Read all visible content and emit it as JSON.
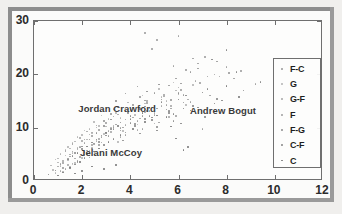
{
  "chart_data": {
    "type": "scatter",
    "title": "",
    "xlabel": "",
    "ylabel": "",
    "xlim": [
      0,
      12
    ],
    "ylim": [
      0,
      30
    ],
    "xticks": [
      0,
      2,
      4,
      6,
      8,
      10,
      12
    ],
    "yticks": [
      0,
      10,
      20,
      30
    ],
    "xtick_labels": [
      "0",
      "2",
      "4",
      "6",
      "8",
      "10",
      "12"
    ],
    "ytick_labels": [
      "0",
      "10",
      "20",
      "30"
    ],
    "grid": false,
    "legend_position": "right-inside",
    "legend": [
      {
        "label": "F-C",
        "color": "#9a9a9a"
      },
      {
        "label": "G",
        "color": "#b4b4b4"
      },
      {
        "label": "G-F",
        "color": "#a8a8a8"
      },
      {
        "label": "F",
        "color": "#a0a0a0"
      },
      {
        "label": "F-G",
        "color": "#909090"
      },
      {
        "label": "C-F",
        "color": "#888888"
      },
      {
        "label": "C",
        "color": "#7e7e7e"
      }
    ],
    "annotations": [
      {
        "text": "Jordan Crawford",
        "x": 3.45,
        "y": 13.6
      },
      {
        "text": "Andrew Bogut",
        "x": 7.85,
        "y": 13.3
      },
      {
        "text": "Jelani McCoy",
        "x": 3.2,
        "y": 5.4
      }
    ],
    "series": [
      {
        "name": "F-C",
        "color": "#9a9a9a",
        "points": [
          [
            1.1,
            3.2
          ],
          [
            1.4,
            4.1
          ],
          [
            1.6,
            5.5
          ],
          [
            1.9,
            6.3
          ],
          [
            2.1,
            7.8
          ],
          [
            2.4,
            9.1
          ],
          [
            2.6,
            10.4
          ],
          [
            2.9,
            11.2
          ],
          [
            3.2,
            12.6
          ],
          [
            3.5,
            13.9
          ],
          [
            3.8,
            11.5
          ],
          [
            4.1,
            14.2
          ],
          [
            4.4,
            15.8
          ],
          [
            4.7,
            13.1
          ],
          [
            5.0,
            16.5
          ],
          [
            5.3,
            14.8
          ],
          [
            5.6,
            17.9
          ],
          [
            5.9,
            19.2
          ],
          [
            6.2,
            16.1
          ],
          [
            6.5,
            20.4
          ],
          [
            1.2,
            2.4
          ],
          [
            1.8,
            3.6
          ],
          [
            2.2,
            5.1
          ],
          [
            2.7,
            6.8
          ],
          [
            3.1,
            8.4
          ],
          [
            3.6,
            9.9
          ],
          [
            4.0,
            10.8
          ],
          [
            4.5,
            12.2
          ],
          [
            5.1,
            13.6
          ],
          [
            5.7,
            15.2
          ],
          [
            6.1,
            18.3
          ],
          [
            6.8,
            21.1
          ],
          [
            7.2,
            19.6
          ],
          [
            7.6,
            22.4
          ],
          [
            8.1,
            20.2
          ],
          [
            2.3,
            4.4
          ],
          [
            2.8,
            7.2
          ],
          [
            3.3,
            10.1
          ],
          [
            3.9,
            12.9
          ],
          [
            4.6,
            15.1
          ]
        ]
      },
      {
        "name": "G",
        "color": "#b4b4b4",
        "points": [
          [
            0.8,
            2.1
          ],
          [
            1.0,
            3.5
          ],
          [
            1.3,
            4.8
          ],
          [
            1.5,
            6.1
          ],
          [
            1.7,
            7.4
          ],
          [
            2.0,
            8.6
          ],
          [
            2.3,
            9.8
          ],
          [
            2.5,
            11.1
          ],
          [
            2.8,
            12.3
          ],
          [
            3.0,
            10.2
          ],
          [
            3.3,
            13.5
          ],
          [
            3.6,
            11.8
          ],
          [
            3.9,
            14.7
          ],
          [
            4.2,
            12.4
          ],
          [
            4.5,
            16.0
          ],
          [
            4.8,
            13.7
          ],
          [
            5.2,
            17.2
          ],
          [
            5.5,
            15.0
          ],
          [
            5.8,
            18.5
          ],
          [
            6.0,
            16.3
          ],
          [
            0.9,
            1.5
          ],
          [
            1.1,
            2.8
          ],
          [
            1.4,
            3.9
          ],
          [
            1.6,
            5.2
          ],
          [
            1.9,
            6.5
          ],
          [
            2.2,
            7.8
          ],
          [
            2.4,
            9.0
          ],
          [
            2.7,
            10.3
          ],
          [
            3.1,
            11.6
          ],
          [
            3.4,
            12.8
          ],
          [
            3.7,
            9.4
          ],
          [
            4.0,
            13.2
          ],
          [
            4.3,
            10.6
          ],
          [
            4.6,
            14.5
          ],
          [
            4.9,
            11.9
          ],
          [
            5.3,
            15.7
          ],
          [
            5.6,
            13.0
          ],
          [
            5.9,
            17.0
          ],
          [
            6.3,
            14.2
          ],
          [
            6.6,
            18.0
          ],
          [
            1.0,
            4.2
          ],
          [
            1.3,
            5.8
          ],
          [
            1.6,
            7.1
          ],
          [
            1.8,
            8.3
          ],
          [
            2.1,
            9.5
          ],
          [
            2.4,
            6.2
          ],
          [
            2.6,
            7.5
          ],
          [
            2.9,
            8.8
          ],
          [
            3.2,
            10.0
          ],
          [
            3.5,
            7.3
          ],
          [
            1.2,
            1.8
          ],
          [
            1.5,
            2.6
          ],
          [
            1.7,
            3.4
          ],
          [
            2.0,
            4.3
          ],
          [
            2.3,
            5.6
          ],
          [
            0.7,
            2.9
          ],
          [
            0.9,
            4.0
          ],
          [
            1.1,
            5.1
          ],
          [
            1.4,
            6.4
          ],
          [
            1.6,
            3.1
          ]
        ]
      },
      {
        "name": "G-F",
        "color": "#a8a8a8",
        "points": [
          [
            1.0,
            2.7
          ],
          [
            1.2,
            3.8
          ],
          [
            1.5,
            5.0
          ],
          [
            1.8,
            6.2
          ],
          [
            2.0,
            7.5
          ],
          [
            2.3,
            8.7
          ],
          [
            2.6,
            10.0
          ],
          [
            2.9,
            11.3
          ],
          [
            3.2,
            9.2
          ],
          [
            3.5,
            12.5
          ],
          [
            3.8,
            10.5
          ],
          [
            4.1,
            13.8
          ],
          [
            4.4,
            11.7
          ],
          [
            4.7,
            15.0
          ],
          [
            5.0,
            12.8
          ],
          [
            5.4,
            16.2
          ],
          [
            5.7,
            14.1
          ],
          [
            6.0,
            17.5
          ],
          [
            6.4,
            15.3
          ],
          [
            6.7,
            18.8
          ],
          [
            1.1,
            1.9
          ],
          [
            1.4,
            3.0
          ],
          [
            1.7,
            4.2
          ],
          [
            2.1,
            5.4
          ],
          [
            2.4,
            6.7
          ],
          [
            2.7,
            7.9
          ],
          [
            3.0,
            9.1
          ],
          [
            3.3,
            10.4
          ],
          [
            3.6,
            8.2
          ],
          [
            4.0,
            11.6
          ],
          [
            4.3,
            9.6
          ],
          [
            4.6,
            12.9
          ],
          [
            5.0,
            10.8
          ],
          [
            5.3,
            14.1
          ],
          [
            5.6,
            12.0
          ],
          [
            1.3,
            5.6
          ],
          [
            1.6,
            6.9
          ],
          [
            1.9,
            8.1
          ],
          [
            2.2,
            9.3
          ],
          [
            2.5,
            7.0
          ]
        ]
      },
      {
        "name": "F",
        "color": "#a0a0a0",
        "points": [
          [
            1.2,
            3.4
          ],
          [
            1.5,
            4.6
          ],
          [
            1.8,
            5.9
          ],
          [
            2.1,
            7.1
          ],
          [
            2.4,
            8.4
          ],
          [
            2.7,
            9.6
          ],
          [
            3.0,
            10.9
          ],
          [
            3.3,
            12.1
          ],
          [
            3.7,
            10.0
          ],
          [
            4.0,
            13.4
          ],
          [
            4.3,
            11.2
          ],
          [
            4.7,
            14.6
          ],
          [
            5.0,
            12.4
          ],
          [
            5.4,
            15.9
          ],
          [
            5.7,
            13.6
          ],
          [
            6.1,
            17.1
          ],
          [
            6.5,
            14.8
          ],
          [
            6.9,
            18.4
          ],
          [
            7.3,
            16.0
          ],
          [
            7.7,
            19.6
          ],
          [
            1.3,
            2.2
          ],
          [
            1.6,
            3.3
          ],
          [
            1.9,
            4.5
          ],
          [
            2.2,
            5.7
          ],
          [
            2.5,
            6.9
          ],
          [
            2.8,
            8.2
          ],
          [
            3.1,
            9.4
          ],
          [
            3.4,
            10.6
          ],
          [
            3.8,
            8.6
          ],
          [
            4.1,
            11.9
          ],
          [
            4.5,
            9.8
          ],
          [
            4.8,
            13.1
          ],
          [
            5.2,
            11.0
          ],
          [
            5.5,
            14.3
          ],
          [
            5.9,
            12.2
          ],
          [
            6.3,
            20.8
          ],
          [
            6.8,
            22.0
          ],
          [
            7.1,
            23.3
          ],
          [
            7.5,
            20.0
          ],
          [
            8.0,
            21.4
          ],
          [
            8.3,
            19.2
          ],
          [
            8.6,
            20.6
          ],
          [
            9.2,
            18.2
          ],
          [
            4.9,
            24.8
          ],
          [
            5.1,
            26.4
          ],
          [
            4.6,
            27.8
          ],
          [
            6.0,
            27.2
          ],
          [
            5.8,
            21.6
          ],
          [
            6.6,
            23.0
          ],
          [
            7.0,
            9.8
          ]
        ]
      },
      {
        "name": "F-G",
        "color": "#909090",
        "points": [
          [
            1.4,
            4.0
          ],
          [
            1.7,
            5.3
          ],
          [
            2.0,
            6.5
          ],
          [
            2.3,
            7.8
          ],
          [
            2.6,
            9.0
          ],
          [
            2.9,
            10.3
          ],
          [
            3.2,
            11.5
          ],
          [
            3.6,
            9.5
          ],
          [
            3.9,
            12.8
          ],
          [
            4.2,
            10.7
          ],
          [
            4.6,
            14.0
          ],
          [
            4.9,
            11.9
          ],
          [
            5.3,
            15.3
          ],
          [
            5.6,
            13.1
          ],
          [
            6.0,
            16.5
          ],
          [
            1.5,
            2.5
          ],
          [
            1.8,
            3.7
          ],
          [
            2.1,
            4.9
          ],
          [
            2.4,
            6.1
          ],
          [
            2.7,
            7.3
          ],
          [
            3.0,
            8.5
          ],
          [
            3.3,
            9.7
          ],
          [
            3.7,
            7.6
          ],
          [
            4.0,
            10.9
          ],
          [
            4.4,
            8.9
          ],
          [
            4.8,
            12.2
          ],
          [
            5.1,
            10.1
          ],
          [
            5.5,
            13.4
          ],
          [
            5.8,
            11.3
          ],
          [
            6.2,
            14.7
          ],
          [
            3.4,
            15.0
          ],
          [
            3.8,
            16.4
          ],
          [
            4.3,
            17.7
          ],
          [
            4.7,
            16.8
          ],
          [
            5.2,
            18.1
          ]
        ]
      },
      {
        "name": "C-F",
        "color": "#888888",
        "points": [
          [
            1.6,
            4.7
          ],
          [
            2.0,
            6.0
          ],
          [
            2.4,
            7.2
          ],
          [
            2.8,
            8.5
          ],
          [
            3.2,
            9.7
          ],
          [
            3.6,
            11.0
          ],
          [
            4.0,
            12.2
          ],
          [
            4.4,
            13.5
          ],
          [
            4.9,
            11.4
          ],
          [
            5.3,
            14.7
          ],
          [
            5.8,
            12.6
          ],
          [
            6.3,
            16.0
          ],
          [
            6.8,
            13.8
          ],
          [
            7.2,
            17.2
          ],
          [
            7.8,
            15.1
          ],
          [
            1.7,
            3.1
          ],
          [
            2.1,
            4.3
          ],
          [
            2.5,
            5.5
          ],
          [
            2.9,
            6.7
          ],
          [
            3.3,
            7.9
          ],
          [
            3.8,
            9.1
          ],
          [
            4.2,
            10.3
          ],
          [
            4.6,
            11.6
          ],
          [
            5.1,
            9.5
          ],
          [
            5.6,
            12.8
          ],
          [
            6.1,
            10.8
          ],
          [
            6.6,
            14.1
          ],
          [
            7.1,
            12.0
          ],
          [
            7.6,
            15.4
          ],
          [
            8.2,
            13.2
          ],
          [
            8.4,
            20.4
          ],
          [
            8.0,
            24.6
          ],
          [
            7.4,
            22.8
          ],
          [
            8.7,
            17.0
          ],
          [
            9.4,
            18.6
          ]
        ]
      },
      {
        "name": "C",
        "color": "#7e7e7e",
        "points": [
          [
            1.8,
            5.2
          ],
          [
            2.2,
            6.5
          ],
          [
            2.6,
            7.8
          ],
          [
            3.0,
            9.0
          ],
          [
            3.5,
            10.3
          ],
          [
            4.0,
            11.5
          ],
          [
            4.5,
            12.8
          ],
          [
            5.0,
            14.0
          ],
          [
            5.5,
            12.0
          ],
          [
            6.0,
            15.3
          ],
          [
            6.5,
            13.2
          ],
          [
            7.0,
            16.6
          ],
          [
            7.5,
            14.5
          ],
          [
            8.0,
            17.8
          ],
          [
            8.5,
            15.7
          ],
          [
            1.9,
            3.6
          ],
          [
            2.3,
            4.8
          ],
          [
            2.7,
            6.1
          ],
          [
            3.1,
            7.3
          ],
          [
            3.6,
            8.6
          ],
          [
            4.1,
            9.8
          ],
          [
            4.6,
            11.1
          ],
          [
            5.1,
            12.3
          ],
          [
            5.7,
            10.2
          ],
          [
            6.2,
            13.6
          ],
          [
            0.6,
            1.2
          ],
          [
            0.9,
            2.0
          ],
          [
            1.2,
            1.6
          ],
          [
            1.5,
            2.4
          ],
          [
            2.0,
            1.9
          ],
          [
            2.4,
            2.7
          ],
          [
            2.9,
            2.2
          ],
          [
            3.4,
            3.0
          ],
          [
            1.0,
            1.0
          ],
          [
            1.7,
            1.4
          ],
          [
            6.2,
            5.8
          ],
          [
            5.9,
            8.0
          ],
          [
            6.4,
            6.4
          ]
        ]
      }
    ]
  }
}
